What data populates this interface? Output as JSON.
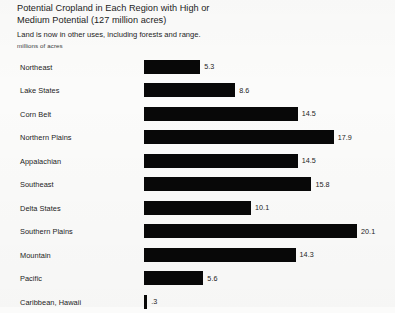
{
  "header": {
    "title": "Potential Cropland in Each Region with High or\nMedium Potential (127 million acres)",
    "subtitle": "Land is now in other uses, including forests and range.",
    "unit_label": "millions of acres"
  },
  "colors": {
    "bar": "#080808",
    "background": "#fbfbfa",
    "text": "#1c1c1c"
  },
  "chart_data": {
    "type": "bar",
    "orientation": "horizontal",
    "title": "Potential Cropland in Each Region with High or Medium Potential (127 million acres)",
    "subtitle": "Land is now in other uses, including forests and range.",
    "xlabel": "millions of acres",
    "ylabel": "",
    "xlim": [
      0,
      20.1
    ],
    "grid": false,
    "legend": false,
    "categories": [
      "Northeast",
      "Lake States",
      "Corn Belt",
      "Northern Plains",
      "Appalachian",
      "Southeast",
      "Delta States",
      "Southern Plains",
      "Mountain",
      "Pacific",
      "Caribbean, Hawaii"
    ],
    "values": [
      5.3,
      8.6,
      14.5,
      17.9,
      14.5,
      15.8,
      10.1,
      20.1,
      14.3,
      5.6,
      0.3
    ],
    "value_labels": [
      "5.3",
      "8.6",
      "14.5",
      "17.9",
      "14.5",
      "15.8",
      "10.1",
      "20.1",
      "14.3",
      "5.6",
      ".3"
    ],
    "total": 127
  }
}
